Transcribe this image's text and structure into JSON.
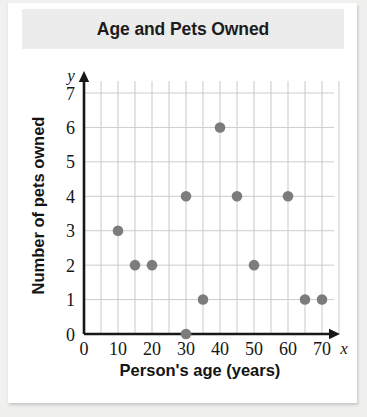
{
  "chart_data": {
    "type": "scatter",
    "title": "Age and Pets Owned",
    "xlabel": "Person's age (years)",
    "ylabel": "Number of pets owned",
    "x_axis_variable": "x",
    "y_axis_variable": "y",
    "xlim": [
      0,
      75
    ],
    "ylim": [
      0,
      7.6
    ],
    "xticks": [
      0,
      10,
      20,
      30,
      40,
      50,
      60,
      70
    ],
    "xtick_labels": [
      "0",
      "10",
      "20",
      "30",
      "40",
      "50",
      "60",
      "70"
    ],
    "yticks": [
      0,
      1,
      2,
      3,
      4,
      5,
      6,
      7
    ],
    "ytick_labels": [
      "0",
      "1",
      "2",
      "3",
      "4",
      "5",
      "6",
      "7"
    ],
    "grid": true,
    "grid_x_step": 5,
    "grid_y_step": 1,
    "legend": "none",
    "marker_color": "#7c7c7c",
    "points": [
      {
        "x": 10,
        "y": 3
      },
      {
        "x": 15,
        "y": 2
      },
      {
        "x": 20,
        "y": 2
      },
      {
        "x": 30,
        "y": 4
      },
      {
        "x": 30,
        "y": 0
      },
      {
        "x": 35,
        "y": 1
      },
      {
        "x": 40,
        "y": 6
      },
      {
        "x": 45,
        "y": 4
      },
      {
        "x": 50,
        "y": 2
      },
      {
        "x": 60,
        "y": 4
      },
      {
        "x": 65,
        "y": 1
      },
      {
        "x": 70,
        "y": 1
      }
    ]
  },
  "colors": {
    "page_background": "#f0f0ee",
    "card_background": "#ffffff",
    "title_banner": "#ececec",
    "marker": "#7c7c7c",
    "gridline": "#c9c9c9",
    "axis": "#171717",
    "text": "#141414"
  }
}
